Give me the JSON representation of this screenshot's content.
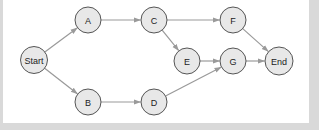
{
  "diagram": {
    "type": "directed-graph",
    "colors": {
      "background": "#d9d9d9",
      "panel": "#ffffff",
      "node_fill": "#e8e8e8",
      "node_stroke": "#555555",
      "edge": "#9a9a9a",
      "label": "#222222"
    },
    "nodes": [
      {
        "id": "start",
        "label": "Start",
        "x": 34,
        "y": 60,
        "r": 13.5
      },
      {
        "id": "a",
        "label": "A",
        "x": 88,
        "y": 20,
        "r": 13
      },
      {
        "id": "b",
        "label": "B",
        "x": 88,
        "y": 102,
        "r": 13
      },
      {
        "id": "c",
        "label": "C",
        "x": 154,
        "y": 20,
        "r": 13
      },
      {
        "id": "d",
        "label": "D",
        "x": 154,
        "y": 102,
        "r": 13
      },
      {
        "id": "e",
        "label": "E",
        "x": 187,
        "y": 61,
        "r": 13
      },
      {
        "id": "f",
        "label": "F",
        "x": 233,
        "y": 20,
        "r": 13
      },
      {
        "id": "g",
        "label": "G",
        "x": 233,
        "y": 61,
        "r": 13
      },
      {
        "id": "end",
        "label": "End",
        "x": 279,
        "y": 61,
        "r": 14
      }
    ],
    "edges": [
      {
        "from": "start",
        "to": "a"
      },
      {
        "from": "start",
        "to": "b"
      },
      {
        "from": "a",
        "to": "c"
      },
      {
        "from": "b",
        "to": "d"
      },
      {
        "from": "c",
        "to": "f"
      },
      {
        "from": "c",
        "to": "e"
      },
      {
        "from": "e",
        "to": "g"
      },
      {
        "from": "d",
        "to": "g"
      },
      {
        "from": "f",
        "to": "end"
      },
      {
        "from": "g",
        "to": "end"
      }
    ]
  }
}
